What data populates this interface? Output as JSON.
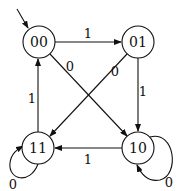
{
  "diagram": {
    "type": "state-machine",
    "start_state": "00",
    "states": [
      {
        "id": "00",
        "label": "00",
        "cx": 39,
        "cy": 42
      },
      {
        "id": "01",
        "label": "01",
        "cx": 138,
        "cy": 42
      },
      {
        "id": "11",
        "label": "11",
        "cx": 38,
        "cy": 148
      },
      {
        "id": "10",
        "label": "10",
        "cx": 138,
        "cy": 148
      }
    ],
    "transitions": [
      {
        "from": "00",
        "to": "01",
        "label": "1"
      },
      {
        "from": "00",
        "to": "10",
        "label": "0"
      },
      {
        "from": "01",
        "to": "11",
        "label": "0"
      },
      {
        "from": "01",
        "to": "10",
        "label": "1"
      },
      {
        "from": "10",
        "to": "11",
        "label": "1"
      },
      {
        "from": "10",
        "to": "10",
        "label": "0"
      },
      {
        "from": "11",
        "to": "00",
        "label": "1"
      },
      {
        "from": "11",
        "to": "11",
        "label": "0"
      }
    ]
  }
}
